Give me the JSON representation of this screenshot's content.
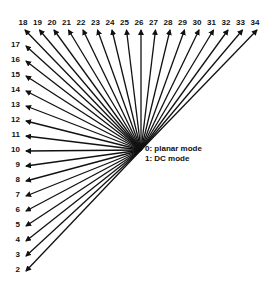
{
  "diagram": {
    "center": {
      "x": 141,
      "y": 150
    },
    "top_modes": [
      "18",
      "19",
      "20",
      "21",
      "22",
      "23",
      "24",
      "25",
      "26",
      "27",
      "28",
      "29",
      "30",
      "31",
      "32",
      "33",
      "34"
    ],
    "left_modes": [
      "17",
      "16",
      "15",
      "14",
      "13",
      "12",
      "11",
      "10",
      "9",
      "8",
      "7",
      "6",
      "5",
      "4",
      "3",
      "2"
    ],
    "legend": {
      "line1": "0: planar mode",
      "line2": "1: DC mode"
    },
    "colors": {
      "arrow": "#111111",
      "background": "#ffffff"
    }
  }
}
